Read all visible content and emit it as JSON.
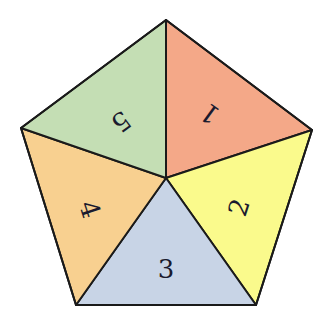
{
  "diagram": {
    "shape": "pentagon divided into 5 triangles from center",
    "center": [
      166,
      178
    ],
    "vertices": {
      "top": [
        166,
        20
      ],
      "right": [
        312,
        130
      ],
      "bottom_right": [
        256,
        305
      ],
      "bottom_left": [
        76,
        305
      ],
      "left": [
        21,
        128
      ]
    },
    "stroke_color": "#1a1a1a",
    "sectors": [
      {
        "label": "1",
        "color": "#f4a888",
        "pos": [
          211,
          112
        ],
        "rotate": -144,
        "points": "top,right"
      },
      {
        "label": "2",
        "color": "#fafa8c",
        "pos": [
          241,
          208
        ],
        "rotate": -72,
        "points": "right,bottom_right"
      },
      {
        "label": "3",
        "color": "#c8d4e6",
        "pos": [
          166,
          271
        ],
        "rotate": 0,
        "points": "bottom_right,bottom_left"
      },
      {
        "label": "4",
        "color": "#f8d090",
        "pos": [
          88,
          210
        ],
        "rotate": 72,
        "points": "bottom_left,left"
      },
      {
        "label": "5",
        "color": "#c4deb4",
        "pos": [
          120,
          120
        ],
        "rotate": 144,
        "points": "left,top"
      }
    ]
  }
}
